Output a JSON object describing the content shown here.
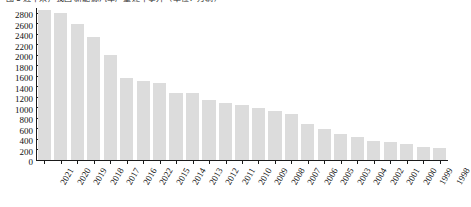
{
  "chart_data": {
    "type": "bar",
    "title": "图 2  近年来，我国 新能源汽车产量逐年攀升（单位：万辆）",
    "xlabel": "",
    "ylabel": "",
    "ylim": [
      0,
      2900
    ],
    "yticks": [
      0,
      200,
      400,
      600,
      800,
      1000,
      1200,
      1400,
      1600,
      1800,
      2000,
      2200,
      2400,
      2600,
      2800
    ],
    "grid": false,
    "legend": "none",
    "bar_color": "#dcdcdc",
    "categories": [
      "2021",
      "2020",
      "2019",
      "2018",
      "2017",
      "2016",
      "2022",
      "2015",
      "2014",
      "2013",
      "2012",
      "2011",
      "2010",
      "2009",
      "2008",
      "2007",
      "2006",
      "2005",
      "2003",
      "2004",
      "2002",
      "2001",
      "2000",
      "1999",
      "1998"
    ],
    "values": [
      2870,
      2800,
      2590,
      2350,
      2000,
      1560,
      1500,
      1470,
      1280,
      1280,
      1140,
      1080,
      1050,
      1000,
      930,
      870,
      690,
      590,
      490,
      430,
      360,
      340,
      300,
      240,
      230
    ]
  }
}
